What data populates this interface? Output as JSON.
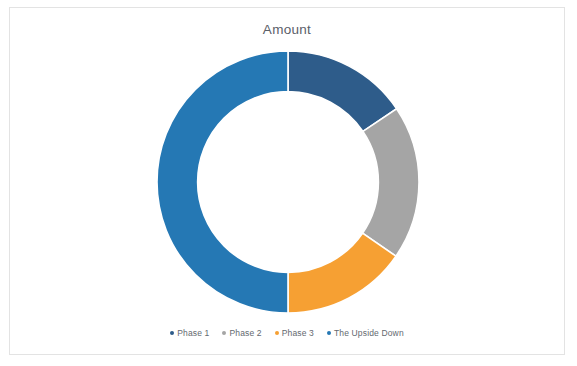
{
  "chart": {
    "title": "Amount",
    "background": "#FFFFFF",
    "border_color": "#E3E3E3"
  },
  "legend": {
    "position": "bottom",
    "items": [
      {
        "label": "Phase 1",
        "color": "#2E5C8A"
      },
      {
        "label": "Phase 2",
        "color": "#A5A5A5"
      },
      {
        "label": "Phase 3",
        "color": "#F6A033"
      },
      {
        "label": "The Upside Down",
        "color": "#2578B4"
      }
    ]
  },
  "chart_data": {
    "type": "pie",
    "variant": "doughnut",
    "title": "Amount",
    "xlabel": "",
    "ylabel": "",
    "legend_position": "bottom",
    "grid": false,
    "hole_ratio": 0.69,
    "start_angle": 0,
    "direction": "clockwise",
    "categories": [
      "Phase 1",
      "Phase 2",
      "Phase 3",
      "The Upside Down"
    ],
    "values": [
      15.5,
      19.0,
      15.5,
      50.0
    ],
    "units": "percent",
    "colors": [
      "#2E5C8A",
      "#A5A5A5",
      "#F6A033",
      "#2578B4"
    ],
    "slices": [
      {
        "label": "Phase 1",
        "value": 15.5,
        "percent": 15.5,
        "start_deg": 0.0,
        "end_deg": 56.0,
        "color": "#2E5C8A"
      },
      {
        "label": "Phase 2",
        "value": 19.0,
        "percent": 19.0,
        "start_deg": 56.0,
        "end_deg": 124.5,
        "color": "#A5A5A5"
      },
      {
        "label": "Phase 3",
        "value": 15.5,
        "percent": 15.5,
        "start_deg": 124.5,
        "end_deg": 180.0,
        "color": "#F6A033"
      },
      {
        "label": "The Upside Down",
        "value": 50.0,
        "percent": 50.0,
        "start_deg": 180.0,
        "end_deg": 360.0,
        "color": "#2578B4"
      }
    ]
  }
}
